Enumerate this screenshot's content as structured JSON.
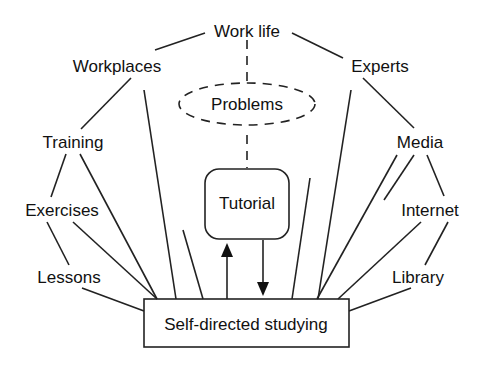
{
  "diagram": {
    "top_node": "Work life",
    "problems_node": "Problems",
    "tutorial_node": "Tutorial",
    "center_node": "Self-directed studying",
    "left_nodes": [
      "Workplaces",
      "Training",
      "Exercises",
      "Lessons"
    ],
    "right_nodes": [
      "Experts",
      "Media",
      "Internet",
      "Library"
    ]
  },
  "colors": {
    "line": "#222222",
    "text": "#111111",
    "background": "#ffffff"
  }
}
